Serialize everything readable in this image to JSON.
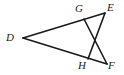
{
  "figure": {
    "kind": "geometry-line-diagram",
    "canvas": {
      "width": 124,
      "height": 75
    },
    "background_color": "#ffffff",
    "stroke_color": "#1a1a1a",
    "stroke_width": 1.6,
    "label_color": "#1a1a1a",
    "points": [
      {
        "id": "D",
        "label": "D",
        "x": 23,
        "y": 38,
        "label_x": 6,
        "label_y": 32
      },
      {
        "id": "G",
        "label": "G",
        "x": 84,
        "y": 19,
        "label_x": 75,
        "label_y": 3
      },
      {
        "id": "E",
        "label": "E",
        "x": 105,
        "y": 13,
        "label_x": 107,
        "label_y": 2
      },
      {
        "id": "H",
        "label": "H",
        "x": 88,
        "y": 59,
        "label_x": 78,
        "label_y": 60
      },
      {
        "id": "F",
        "label": "F",
        "x": 107,
        "y": 64,
        "label_x": 108,
        "label_y": 60
      },
      {
        "id": "X",
        "label": "",
        "x": 92,
        "y": 39,
        "label_x": 0,
        "label_y": 0
      }
    ],
    "segments": [
      {
        "id": "D-E",
        "from": "D",
        "to": "E",
        "through": "G"
      },
      {
        "id": "D-F",
        "from": "D",
        "to": "F",
        "through": "H"
      },
      {
        "id": "G-F",
        "from": "G",
        "to": "F",
        "crosses": "H-E"
      },
      {
        "id": "H-E",
        "from": "H",
        "to": "E",
        "crosses": "G-F"
      }
    ]
  }
}
